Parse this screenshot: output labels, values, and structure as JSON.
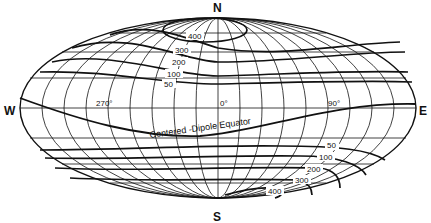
{
  "map": {
    "projection": "Aitoff/Hammer equal-area (oval world projection)",
    "compass": {
      "north": "N",
      "south": "S",
      "west": "W",
      "east": "E"
    },
    "longitude_labels": [
      "270°",
      "0°",
      "90°"
    ],
    "equator_label": "Centered -Dipole Equator",
    "north_contours": [
      "400",
      "300",
      "200",
      "100",
      "50"
    ],
    "south_contours": [
      "50",
      "100",
      "200",
      "300",
      "400"
    ],
    "colors": {
      "ink": "#111111",
      "background": "#ffffff"
    }
  }
}
